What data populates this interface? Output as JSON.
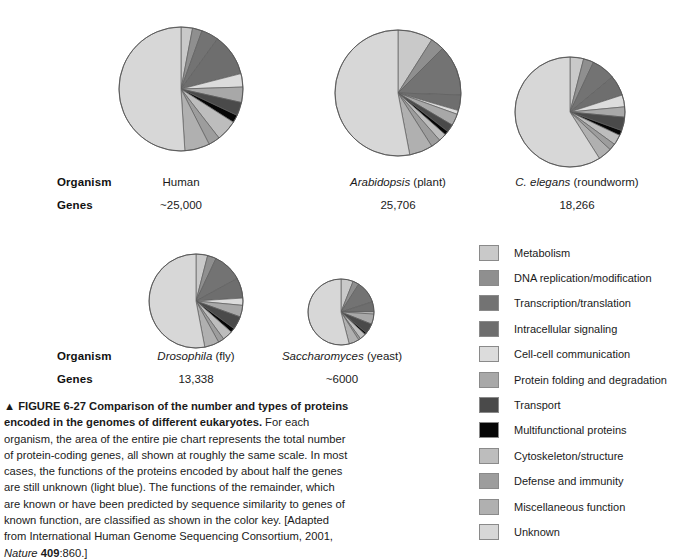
{
  "figure": {
    "marker": "▲",
    "number": "FIGURE 6-27",
    "title": "Comparison of the number and types of proteins encoded in the genomes of different eukaryotes.",
    "body_part1": " For each organism, the area of the entire pie chart represents the total number of protein-coding genes, all shown at roughly the same scale. In most cases, the functions of the proteins encoded by about half the genes are still unknown (light blue). The functions of the remainder, which are known or have been predicted by sequence similarity to genes of known function, are classified as shown in the color key. [Adapted from International Human Genome Sequencing Consortium, 2001, ",
    "source_italic": "Nature",
    "source_volume": "409",
    "source_tail": ":860.]"
  },
  "table": {
    "row_labels": [
      "Organism",
      "Genes"
    ],
    "top_row": [
      {
        "organism_plain": "Human",
        "organism_italic": "",
        "organism_suffix": "",
        "genes": "~25,000"
      },
      {
        "organism_plain": "",
        "organism_italic": "Arabidopsis",
        "organism_suffix": " (plant)",
        "genes": "25,706"
      },
      {
        "organism_plain": "",
        "organism_italic": "C. elegans",
        "organism_suffix": " (roundworm)",
        "genes": "18,266"
      }
    ],
    "bottom_row": [
      {
        "organism_plain": "",
        "organism_italic": "Drosophila",
        "organism_suffix": " (fly)",
        "genes": "13,338"
      },
      {
        "organism_plain": "",
        "organism_italic": "Saccharomyces",
        "organism_suffix": " (yeast)",
        "genes": "~6000"
      }
    ]
  },
  "legend": {
    "items": [
      {
        "label": "Metabolism",
        "color": "#c9c9c9"
      },
      {
        "label": "DNA replication/modification",
        "color": "#8f8f8f"
      },
      {
        "label": "Transcription/translation",
        "color": "#737373"
      },
      {
        "label": "Intracellular signaling",
        "color": "#6e6e6e"
      },
      {
        "label": "Cell-cell communication",
        "color": "#dcdcdc"
      },
      {
        "label": "Protein folding and degradation",
        "color": "#a8a8a8"
      },
      {
        "label": "Transport",
        "color": "#4a4a4a"
      },
      {
        "label": "Multifunctional proteins",
        "color": "#060606"
      },
      {
        "label": "Cytoskeleton/structure",
        "color": "#bdbdbd"
      },
      {
        "label": "Defense and immunity",
        "color": "#9d9d9d"
      },
      {
        "label": "Miscellaneous function",
        "color": "#b0b0b0"
      },
      {
        "label": "Unknown",
        "color": "#d7d7d7"
      }
    ]
  },
  "chart_data": [
    {
      "type": "pie",
      "title": "Human",
      "total_genes": 25000,
      "radius_px": 62,
      "center": [
        181,
        89
      ],
      "start_angle_deg": -90,
      "categories": [
        "Metabolism",
        "DNA replication/modification",
        "Transcription/translation",
        "Intracellular signaling",
        "Cell-cell communication",
        "Protein folding and degradation",
        "Transport",
        "Multifunctional proteins",
        "Cytoskeleton/structure",
        "Defense and immunity",
        "Miscellaneous function",
        "Unknown"
      ],
      "values": [
        3.0,
        2.5,
        4.5,
        11.0,
        3.5,
        4.0,
        3.5,
        2.0,
        5.5,
        3.0,
        6.5,
        51.0
      ]
    },
    {
      "type": "pie",
      "title": "Arabidopsis (plant)",
      "total_genes": 25706,
      "radius_px": 63,
      "center": [
        398,
        93
      ],
      "start_angle_deg": -90,
      "categories": [
        "Metabolism",
        "DNA replication/modification",
        "Transcription/translation",
        "Intracellular signaling",
        "Cell-cell communication",
        "Protein folding and degradation",
        "Transport",
        "Multifunctional proteins",
        "Cytoskeleton/structure",
        "Defense and immunity",
        "Miscellaneous function",
        "Unknown"
      ],
      "values": [
        9.0,
        3.5,
        13.0,
        4.0,
        1.0,
        3.0,
        2.0,
        1.0,
        2.0,
        2.5,
        6.0,
        53.0
      ]
    },
    {
      "type": "pie",
      "title": "C. elegans (roundworm)",
      "total_genes": 18266,
      "radius_px": 55,
      "center": [
        570,
        112
      ],
      "start_angle_deg": -90,
      "categories": [
        "Metabolism",
        "DNA replication/modification",
        "Transcription/translation",
        "Intracellular signaling",
        "Cell-cell communication",
        "Protein folding and degradation",
        "Transport",
        "Multifunctional proteins",
        "Cytoskeleton/structure",
        "Defense and immunity",
        "Miscellaneous function",
        "Unknown"
      ],
      "values": [
        4.0,
        3.0,
        7.0,
        6.0,
        3.5,
        3.0,
        4.0,
        1.5,
        3.0,
        2.0,
        4.0,
        59.0
      ]
    },
    {
      "type": "pie",
      "title": "Drosophila (fly)",
      "total_genes": 13338,
      "radius_px": 47,
      "center": [
        196,
        301
      ],
      "start_angle_deg": -90,
      "categories": [
        "Metabolism",
        "DNA replication/modification",
        "Transcription/translation",
        "Intracellular signaling",
        "Cell-cell communication",
        "Protein folding and degradation",
        "Transport",
        "Multifunctional proteins",
        "Cytoskeleton/structure",
        "Defense and immunity",
        "Miscellaneous function",
        "Unknown"
      ],
      "values": [
        4.0,
        3.0,
        10.0,
        7.0,
        2.5,
        4.0,
        4.5,
        1.5,
        3.5,
        2.0,
        5.0,
        53.0
      ]
    },
    {
      "type": "pie",
      "title": "Saccharomyces (yeast)",
      "total_genes": 6000,
      "radius_px": 33,
      "center": [
        341,
        312
      ],
      "start_angle_deg": -90,
      "categories": [
        "Metabolism",
        "DNA replication/modification",
        "Transcription/translation",
        "Intracellular signaling",
        "Cell-cell communication",
        "Protein folding and degradation",
        "Transport",
        "Multifunctional proteins",
        "Cytoskeleton/structure",
        "Defense and immunity",
        "Miscellaneous function",
        "Unknown"
      ],
      "values": [
        6.0,
        3.0,
        11.0,
        5.0,
        1.0,
        5.0,
        5.0,
        1.0,
        3.0,
        1.0,
        5.0,
        54.0
      ]
    }
  ]
}
